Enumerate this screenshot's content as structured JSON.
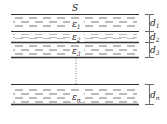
{
  "diagram": {
    "top_label": "S",
    "layers": [
      {
        "epsilon": "ε",
        "eps_sub": "1",
        "d": "d",
        "d_sub": "1"
      },
      {
        "epsilon": "ε",
        "eps_sub": "2",
        "d": "d",
        "d_sub": "2"
      },
      {
        "epsilon": "ε",
        "eps_sub": "3",
        "d": "d",
        "d_sub": "3"
      },
      {
        "epsilon": "ε",
        "eps_sub": "n",
        "d": "d",
        "d_sub": "n"
      }
    ]
  }
}
